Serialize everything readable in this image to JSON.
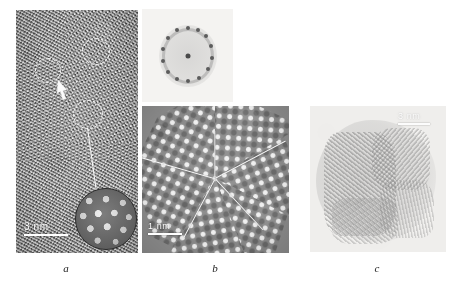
{
  "figure": {
    "type": "tem-micrograph-figure",
    "panel_count": 3,
    "background_color": "#ffffff"
  },
  "panels": [
    {
      "id": "a",
      "caption": "a",
      "kind": "hrtem-lattice-image",
      "scalebar": {
        "label": "3 nm",
        "position": "bottom-left",
        "color": "#ffffff"
      },
      "annotations": {
        "dashed_circles": 3,
        "arrow": {
          "direction": "up-left",
          "color": "#ffffff"
        },
        "magnified_inset": {
          "shape": "circle",
          "border_color": "#2a2a2a"
        },
        "leader_line": true
      }
    },
    {
      "id": "b",
      "caption": "b",
      "kind": "hrtem-five-fold-twin",
      "scalebar": {
        "label": "1 nm",
        "position": "bottom-left",
        "color": "#ffffff"
      },
      "inset": {
        "kind": "electron-diffraction-pattern",
        "position": "above",
        "ring_spots": 14,
        "center_spot": true
      },
      "annotations": {
        "twin_boundary_lines": 5,
        "line_color": "#f5f5f5",
        "angles_deg": [
          90,
          162,
          234,
          306,
          18
        ]
      }
    },
    {
      "id": "c",
      "caption": "c",
      "kind": "hrtem-lattice-fringes",
      "scalebar": {
        "label": "3 nm",
        "position": "top-right",
        "color": "#ffffff"
      }
    }
  ],
  "colors": {
    "page_background": "#ffffff",
    "panel_a_base": "#9a9a9a",
    "panel_b_base": "#8a8a8a",
    "panel_c_base": "#efeeec",
    "annotation_white": "#ffffff",
    "caption_text": "#1b1b1b",
    "diffraction_spot": "#5c5c5c"
  }
}
